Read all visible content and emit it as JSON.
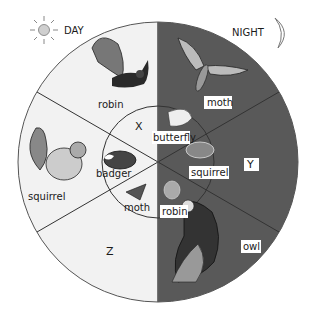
{
  "header": {
    "day_label": "DAY",
    "night_label": "NIGHT",
    "day_icon": "sun-icon",
    "night_icon": "crescent-moon-icon"
  },
  "colors": {
    "day_fill": "#f2f2f2",
    "night_fill": "#595959",
    "line": "#333333",
    "label_box": "#ffffff"
  },
  "diagram": {
    "outer_ring": {
      "day_side": [
        {
          "id": "top-left",
          "animal": "robin"
        },
        {
          "id": "left",
          "animal": "squirrel"
        },
        {
          "id": "bottom-left",
          "label": "Z"
        }
      ],
      "night_side": [
        {
          "id": "top-right",
          "animal": "moth"
        },
        {
          "id": "right",
          "label": "Y"
        },
        {
          "id": "bottom-right",
          "animal": "owl"
        }
      ]
    },
    "inner_circle": {
      "day_side": [
        {
          "id": "top-left",
          "label": "X"
        },
        {
          "id": "left",
          "animal": "badger"
        },
        {
          "id": "bottom-left",
          "animal": "moth"
        }
      ],
      "night_side": [
        {
          "id": "top-right",
          "animal": "butterfly"
        },
        {
          "id": "right",
          "animal": "squirrel"
        },
        {
          "id": "bottom-right",
          "animal": "robin"
        }
      ]
    }
  },
  "labels": {
    "outer_robin": "robin",
    "outer_squirrel": "squirrel",
    "outer_z": "Z",
    "outer_moth": "moth",
    "outer_y": "Y",
    "outer_owl": "owl",
    "inner_x": "X",
    "inner_badger": "badger",
    "inner_moth": "moth",
    "inner_butterfly": "butterfly",
    "inner_squirrel": "squirrel",
    "inner_robin": "robin"
  }
}
